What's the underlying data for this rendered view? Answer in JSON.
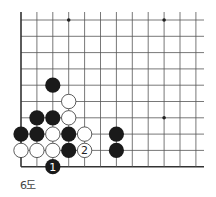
{
  "diagram": {
    "caption": "6도",
    "grid": {
      "cols": 12,
      "rows": 10,
      "x0": 21,
      "y0": 20,
      "dx": 15.9,
      "dy": 16.3,
      "right_extent": 204,
      "left_edge": true,
      "bottom_edge": true
    },
    "star_points": [
      {
        "col": 3,
        "row": 0
      },
      {
        "col": 9,
        "row": 0
      },
      {
        "col": 9,
        "row": 6
      }
    ],
    "stones": [
      {
        "color": "black",
        "col": 2,
        "row": 4
      },
      {
        "color": "white",
        "col": 3,
        "row": 5
      },
      {
        "color": "black",
        "col": 1,
        "row": 6
      },
      {
        "color": "black",
        "col": 2,
        "row": 6
      },
      {
        "color": "white",
        "col": 3,
        "row": 6
      },
      {
        "color": "black",
        "col": 0,
        "row": 7
      },
      {
        "color": "black",
        "col": 1,
        "row": 7
      },
      {
        "color": "white",
        "col": 2,
        "row": 7
      },
      {
        "color": "black",
        "col": 3,
        "row": 7
      },
      {
        "color": "white",
        "col": 4,
        "row": 7
      },
      {
        "color": "black",
        "col": 6,
        "row": 7
      },
      {
        "color": "white",
        "col": 0,
        "row": 8
      },
      {
        "color": "white",
        "col": 1,
        "row": 8
      },
      {
        "color": "white",
        "col": 2,
        "row": 8
      },
      {
        "color": "black",
        "col": 3,
        "row": 8
      },
      {
        "color": "white",
        "col": 4,
        "row": 8,
        "label": "2"
      },
      {
        "color": "black",
        "col": 6,
        "row": 8
      },
      {
        "color": "black",
        "col": 2,
        "row": 9,
        "label": "1"
      }
    ],
    "colors": {
      "line": "#555555",
      "edge": "#333333",
      "black_stone": "#1a1a1a",
      "white_stone": "#ffffff",
      "white_outline": "#333333"
    }
  }
}
